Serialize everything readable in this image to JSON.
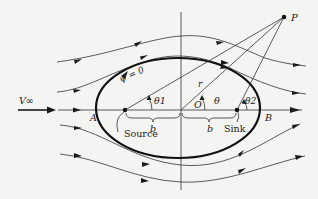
{
  "diagram": {
    "labels": {
      "free_stream": "V∞",
      "point_p": "P",
      "stream_function": "ψ = 0",
      "radius": "r",
      "theta": "θ",
      "theta1": "θ1",
      "theta2": "θ2",
      "origin": "O",
      "stagnation_a": "A",
      "stagnation_b": "B",
      "half_distance_left": "b",
      "half_distance_right": "b",
      "source": "Source",
      "sink": "Sink"
    },
    "colors": {
      "background": "#f4f4f2",
      "ink": "#1a1a1a",
      "streamline": "#333333"
    }
  }
}
